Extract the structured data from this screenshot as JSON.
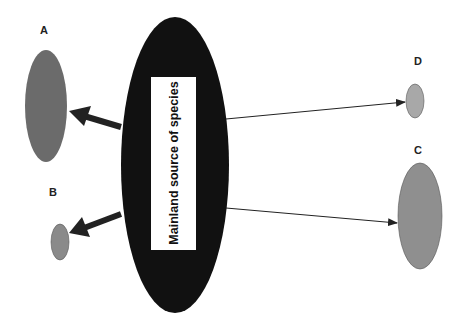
{
  "diagram": {
    "mainland": {
      "label": "Mainland source of species",
      "fill": "#111111",
      "box_fill": "#ffffff"
    },
    "islands": [
      {
        "id": "A",
        "label": "A",
        "fill": "#6b6b6b",
        "size": "large",
        "distance": "near",
        "arrow": "thick"
      },
      {
        "id": "B",
        "label": "B",
        "fill": "#8a8a8a",
        "size": "small",
        "distance": "near",
        "arrow": "thick"
      },
      {
        "id": "D",
        "label": "D",
        "fill": "#a8a8a8",
        "size": "small",
        "distance": "far",
        "arrow": "thin"
      },
      {
        "id": "C",
        "label": "C",
        "fill": "#8f8f8f",
        "size": "large",
        "distance": "far",
        "arrow": "thin"
      }
    ],
    "arrow_color": "#222222"
  }
}
